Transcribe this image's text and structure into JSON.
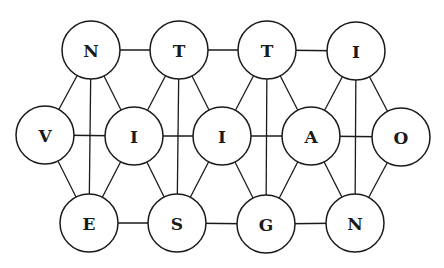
{
  "diagram": {
    "type": "letter-graph",
    "width": 444,
    "height": 268,
    "node_radius": 29,
    "colors": {
      "stroke": "#1a1a1a",
      "fill": "#ffffff",
      "background": "#ffffff"
    },
    "nodes": [
      {
        "id": "n_top",
        "label": "N",
        "x": 91,
        "y": 50
      },
      {
        "id": "t1",
        "label": "T",
        "x": 179,
        "y": 50
      },
      {
        "id": "t2",
        "label": "T",
        "x": 267,
        "y": 50
      },
      {
        "id": "i_top",
        "label": "I",
        "x": 356,
        "y": 51
      },
      {
        "id": "v",
        "label": "V",
        "x": 45,
        "y": 135
      },
      {
        "id": "i1",
        "label": "I",
        "x": 134,
        "y": 136
      },
      {
        "id": "i2",
        "label": "I",
        "x": 222,
        "y": 136
      },
      {
        "id": "a",
        "label": "A",
        "x": 311,
        "y": 136
      },
      {
        "id": "o",
        "label": "O",
        "x": 401,
        "y": 137
      },
      {
        "id": "e",
        "label": "E",
        "x": 89,
        "y": 223
      },
      {
        "id": "s",
        "label": "S",
        "x": 177,
        "y": 223
      },
      {
        "id": "g",
        "label": "G",
        "x": 266,
        "y": 224
      },
      {
        "id": "n_bot",
        "label": "N",
        "x": 355,
        "y": 223
      }
    ],
    "edges": [
      [
        "n_top",
        "t1"
      ],
      [
        "t1",
        "t2"
      ],
      [
        "t2",
        "i_top"
      ],
      [
        "v",
        "i1"
      ],
      [
        "i1",
        "i2"
      ],
      [
        "i2",
        "a"
      ],
      [
        "a",
        "o"
      ],
      [
        "e",
        "s"
      ],
      [
        "s",
        "g"
      ],
      [
        "g",
        "n_bot"
      ],
      [
        "n_top",
        "v"
      ],
      [
        "n_top",
        "e"
      ],
      [
        "n_top",
        "i1"
      ],
      [
        "t1",
        "i1"
      ],
      [
        "t1",
        "s"
      ],
      [
        "t1",
        "i2"
      ],
      [
        "t2",
        "i2"
      ],
      [
        "t2",
        "g"
      ],
      [
        "t2",
        "a"
      ],
      [
        "i_top",
        "a"
      ],
      [
        "i_top",
        "n_bot"
      ],
      [
        "i_top",
        "o"
      ],
      [
        "v",
        "e"
      ],
      [
        "i1",
        "e"
      ],
      [
        "i1",
        "s"
      ],
      [
        "i2",
        "s"
      ],
      [
        "i2",
        "g"
      ],
      [
        "a",
        "g"
      ],
      [
        "a",
        "n_bot"
      ],
      [
        "o",
        "n_bot"
      ]
    ]
  }
}
